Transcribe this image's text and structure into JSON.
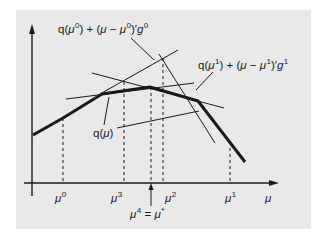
{
  "figure": {
    "background": "#e9e9ea",
    "line_color": "#1a1a1a",
    "axes": {
      "x_label": "μ",
      "y_label": ""
    },
    "curve": {
      "label_main": "q(",
      "label_var": "μ",
      "label_close": ")"
    },
    "tangent_0": {
      "p1": "q(",
      "p2": "μ",
      "sup1": "0",
      "p3": ") + (",
      "p4": "μ",
      "p5": " − ",
      "p6": "μ",
      "sup2": "0",
      "p7": ")′",
      "p8": "g",
      "sup3": "0"
    },
    "tangent_1": {
      "p1": "q(",
      "p2": "μ",
      "sup1": "1",
      "p3": ") + (",
      "p4": "μ",
      "p5": " − ",
      "p6": "μ",
      "sup2": "1",
      "p7": ")′",
      "p8": "g",
      "sup3": "1"
    },
    "ticks": [
      {
        "base": "μ",
        "sup": "0"
      },
      {
        "base": "μ",
        "sup": "3"
      },
      {
        "base": "μ",
        "sup": "2"
      },
      {
        "base": "μ",
        "sup": "1"
      }
    ],
    "optimum": {
      "base": "μ",
      "sup": "4",
      "eq": " = ",
      "star_base": "μ",
      "star_sup": "*"
    }
  }
}
